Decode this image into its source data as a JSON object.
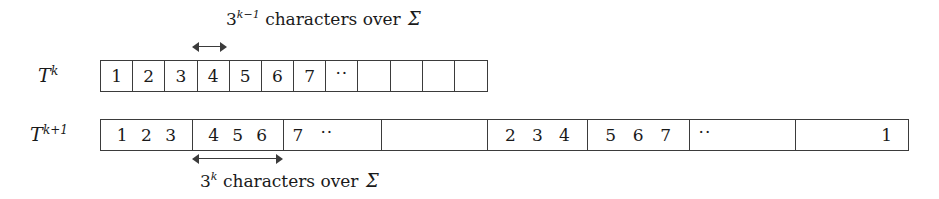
{
  "figure": {
    "background": "#ffffff",
    "ink": "#3b3b3b"
  },
  "rows": [
    {
      "id": "row-tk",
      "label_base": "T",
      "label_sup": "k",
      "cell_count": 12,
      "cells": [
        "1",
        "2",
        "3",
        "4",
        "5",
        "6",
        "7",
        "··",
        "",
        "",
        "",
        ""
      ]
    },
    {
      "id": "row-tk1",
      "label_base": "T",
      "label_sup": "k+1",
      "cell_count": 8,
      "cells": [
        {
          "kind": "group",
          "items": [
            "1",
            "2",
            "3"
          ]
        },
        {
          "kind": "group",
          "items": [
            "4",
            "5",
            "6"
          ]
        },
        {
          "kind": "left",
          "items": [
            "7",
            "··"
          ]
        },
        {
          "kind": "empty",
          "items": []
        },
        {
          "kind": "group",
          "items": [
            "2",
            "3",
            "4"
          ]
        },
        {
          "kind": "group",
          "items": [
            "5",
            "6",
            "7"
          ]
        },
        {
          "kind": "left",
          "items": [
            "··"
          ]
        },
        {
          "kind": "right",
          "items": [
            "1"
          ]
        }
      ]
    }
  ],
  "annotations": {
    "top": {
      "base": "3",
      "sup": "k−1",
      "text": "characters over",
      "symbol": "Σ",
      "full": "3^{k-1} characters over Σ"
    },
    "bottom": {
      "base": "3",
      "sup": "k",
      "text": "characters over",
      "symbol": "Σ",
      "full": "3^{k} characters over Σ"
    }
  },
  "arrows": {
    "top": {
      "name": "span-arrow-top",
      "spans": "one cell of row T^k"
    },
    "bottom": {
      "name": "span-arrow-bottom",
      "spans": "one block of row T^{k+1}"
    }
  }
}
